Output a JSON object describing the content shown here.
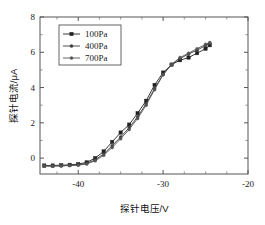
{
  "chart_data": {
    "type": "line",
    "title": "",
    "subtitle": "",
    "xlabel": "探针电压/V",
    "ylabel": "探针电流/μA",
    "xlim": [
      -44.5,
      -20
    ],
    "ylim": [
      -0.9,
      8
    ],
    "xticks": [
      -40,
      -30,
      -20
    ],
    "xtick_labels": [
      "-40",
      "-30",
      "-20"
    ],
    "yticks": [
      0,
      2,
      4,
      6,
      8
    ],
    "ytick_labels": [
      "0",
      "2",
      "4",
      "6",
      "8"
    ],
    "x_minor_ticks": [
      -42.5,
      -37.5,
      -35,
      -32.5,
      -27.5,
      -25,
      -22.5
    ],
    "y_minor_ticks": [
      1,
      3,
      5,
      7
    ],
    "grid": false,
    "legend_position": "upper-left-inside",
    "series": [
      {
        "name": "100Pa",
        "color": "#222222",
        "marker": "filled-square",
        "x": [
          -44.0,
          -43.0,
          -42.0,
          -41.0,
          -40.0,
          -39.0,
          -38.0,
          -37.0,
          -36.0,
          -35.0,
          -34.0,
          -33.0,
          -32.0,
          -31.0,
          -30.0,
          -29.0,
          -28.0,
          -27.0,
          -26.0,
          -25.0,
          -24.5
        ],
        "y": [
          -0.42,
          -0.42,
          -0.4,
          -0.38,
          -0.34,
          -0.24,
          0.0,
          0.38,
          0.92,
          1.45,
          1.9,
          2.55,
          3.25,
          4.15,
          4.85,
          5.3,
          5.55,
          5.7,
          5.95,
          6.2,
          6.4
        ]
      },
      {
        "name": "400Pa",
        "color": "#3a3a3a",
        "marker": "filled-dot",
        "x": [
          -44.0,
          -43.0,
          -42.0,
          -41.0,
          -40.0,
          -39.0,
          -38.0,
          -37.0,
          -36.0,
          -35.0,
          -34.0,
          -33.0,
          -32.0,
          -31.0,
          -30.0,
          -29.0,
          -28.0,
          -27.0,
          -26.0,
          -25.0,
          -24.5
        ],
        "y": [
          -0.44,
          -0.44,
          -0.43,
          -0.41,
          -0.38,
          -0.3,
          -0.1,
          0.24,
          0.7,
          1.2,
          1.72,
          2.35,
          3.08,
          3.95,
          4.75,
          5.3,
          5.65,
          5.9,
          6.12,
          6.38,
          6.5
        ]
      },
      {
        "name": "700Pa",
        "color": "#555555",
        "marker": "filled-dot",
        "x": [
          -44.0,
          -43.0,
          -42.0,
          -41.0,
          -40.0,
          -39.0,
          -38.0,
          -37.0,
          -36.0,
          -35.0,
          -34.0,
          -33.0,
          -32.0,
          -31.0,
          -30.0,
          -29.0,
          -28.0,
          -27.0,
          -26.0,
          -25.0,
          -24.5
        ],
        "y": [
          -0.45,
          -0.45,
          -0.44,
          -0.42,
          -0.4,
          -0.33,
          -0.15,
          0.16,
          0.6,
          1.1,
          1.62,
          2.25,
          3.0,
          3.88,
          4.72,
          5.32,
          5.7,
          5.95,
          6.2,
          6.45,
          6.55
        ]
      }
    ],
    "legend_entries": [
      {
        "label": "100Pa",
        "color": "#222222",
        "marker": "filled-square"
      },
      {
        "label": "400Pa",
        "color": "#3a3a3a",
        "marker": "filled-dot"
      },
      {
        "label": "700Pa",
        "color": "#555555",
        "marker": "filled-dot"
      }
    ]
  },
  "figure": {
    "background_color": "#ffffff",
    "frame_color": "#555555"
  }
}
